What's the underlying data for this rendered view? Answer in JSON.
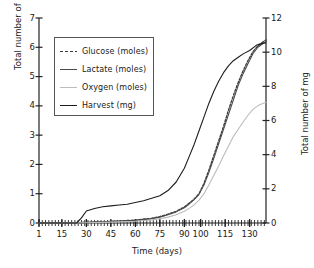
{
  "chart_data": {
    "type": "line",
    "title": "",
    "xlabel": "Time (days)",
    "ylabel": "Total number of moles",
    "ylabel_right": "Total number of mg",
    "xlim": [
      1,
      140
    ],
    "ylim": [
      0,
      7
    ],
    "ylim_right": [
      0,
      12
    ],
    "grid": false,
    "legend_position": "upper-left-inside",
    "xticks": [
      1,
      15,
      30,
      45,
      60,
      75,
      90,
      100,
      115,
      130
    ],
    "xtick_labels": [
      "1",
      "15",
      "30",
      "45",
      "60",
      "75",
      "90",
      "100",
      "115",
      "130"
    ],
    "yticks_left": [
      0,
      1,
      2,
      3,
      4,
      5,
      6,
      7
    ],
    "ytick_labels_left": [
      "0",
      "1",
      "2",
      "3",
      "4",
      "5",
      "6",
      "7"
    ],
    "yticks_right": [
      0,
      2,
      4,
      6,
      8,
      10,
      12
    ],
    "ytick_labels_right": [
      "0",
      "2",
      "4",
      "6",
      "8",
      "10",
      "12"
    ],
    "series": [
      {
        "name": "Glucose (moles)",
        "axis": "left",
        "color": "#3a3a3a",
        "style": "dashed",
        "x": [
          1,
          15,
          30,
          40,
          50,
          60,
          70,
          75,
          80,
          85,
          90,
          93,
          96,
          99,
          102,
          105,
          108,
          111,
          114,
          117,
          120,
          123,
          126,
          129,
          132,
          135,
          138,
          140
        ],
        "values": [
          0.0,
          0.0,
          0.02,
          0.04,
          0.07,
          0.1,
          0.16,
          0.22,
          0.3,
          0.4,
          0.55,
          0.68,
          0.82,
          1.0,
          1.35,
          1.8,
          2.3,
          2.8,
          3.3,
          3.85,
          4.35,
          4.8,
          5.2,
          5.55,
          5.85,
          6.05,
          6.18,
          6.25
        ]
      },
      {
        "name": "Lactate (moles)",
        "axis": "left",
        "color": "#4a4a4a",
        "style": "solid",
        "x": [
          1,
          15,
          30,
          40,
          50,
          60,
          70,
          75,
          80,
          85,
          90,
          93,
          96,
          99,
          102,
          105,
          108,
          111,
          114,
          117,
          120,
          123,
          126,
          129,
          132,
          135,
          138,
          140
        ],
        "values": [
          0.0,
          0.0,
          0.02,
          0.04,
          0.06,
          0.09,
          0.15,
          0.2,
          0.28,
          0.38,
          0.52,
          0.65,
          0.8,
          0.98,
          1.3,
          1.72,
          2.2,
          2.7,
          3.2,
          3.7,
          4.2,
          4.7,
          5.1,
          5.45,
          5.78,
          6.0,
          6.12,
          6.2
        ]
      },
      {
        "name": "Oxygen (moles)",
        "axis": "left",
        "color": "#bcbcbc",
        "style": "solid",
        "x": [
          1,
          15,
          30,
          40,
          50,
          60,
          70,
          75,
          80,
          85,
          90,
          93,
          96,
          99,
          102,
          105,
          108,
          111,
          114,
          117,
          120,
          123,
          126,
          129,
          132,
          135,
          138,
          140
        ],
        "values": [
          0.0,
          0.0,
          0.01,
          0.02,
          0.04,
          0.06,
          0.1,
          0.15,
          0.2,
          0.28,
          0.4,
          0.5,
          0.62,
          0.78,
          1.0,
          1.3,
          1.62,
          1.95,
          2.3,
          2.62,
          2.95,
          3.2,
          3.45,
          3.68,
          3.88,
          4.0,
          4.08,
          4.12
        ]
      },
      {
        "name": "Harvest (mg)",
        "axis": "right",
        "color": "#1c1c1c",
        "style": "solid",
        "x": [
          1,
          15,
          24,
          27,
          30,
          35,
          40,
          45,
          50,
          55,
          60,
          65,
          70,
          75,
          80,
          85,
          90,
          93,
          96,
          99,
          102,
          105,
          108,
          111,
          114,
          117,
          120,
          123,
          126,
          130,
          134,
          137,
          140
        ],
        "values": [
          0.0,
          0.0,
          0.0,
          0.3,
          0.7,
          0.85,
          0.95,
          1.0,
          1.05,
          1.1,
          1.2,
          1.3,
          1.45,
          1.6,
          1.9,
          2.4,
          3.2,
          3.9,
          4.6,
          5.4,
          6.2,
          7.0,
          7.7,
          8.3,
          8.8,
          9.2,
          9.5,
          9.7,
          9.9,
          10.1,
          10.4,
          10.5,
          10.55
        ]
      }
    ]
  },
  "legend": {
    "items": [
      {
        "label": "Glucose (moles)",
        "color": "#3a3a3a",
        "style": "dashed"
      },
      {
        "label": "Lactate (moles)",
        "color": "#4a4a4a",
        "style": "solid"
      },
      {
        "label": "Oxygen (moles)",
        "color": "#bcbcbc",
        "style": "solid"
      },
      {
        "label": "Harvest (mg)",
        "color": "#1c1c1c",
        "style": "solid"
      }
    ]
  },
  "axes": {
    "x_title": "Time (days)",
    "y_left_title": "Total number of moles",
    "y_right_title": "Total number of mg"
  }
}
